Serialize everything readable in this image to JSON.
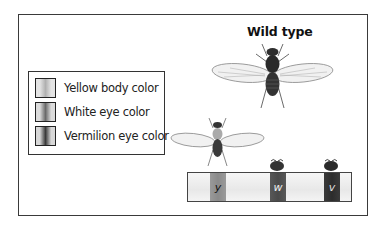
{
  "title": "Wild type",
  "legend": {
    "items": [
      {
        "label": "Yellow body color",
        "icon": "yellow-band-swatch"
      },
      {
        "label": "White eye color",
        "icon": "white-band-swatch"
      },
      {
        "label": "Vermilion eye color",
        "icon": "vermilion-band-swatch"
      }
    ]
  },
  "chromosome": {
    "genes": [
      {
        "symbol": "y",
        "name": "yellow"
      },
      {
        "symbol": "w",
        "name": "white"
      },
      {
        "symbol": "v",
        "name": "vermilion"
      }
    ]
  },
  "illustrations": {
    "wild_type_fly": "fly-wild-type",
    "mutant_fly": "fly-yellow-body",
    "eye_heads": [
      "fly-head-white-eye",
      "fly-head-vermilion-eye"
    ]
  }
}
